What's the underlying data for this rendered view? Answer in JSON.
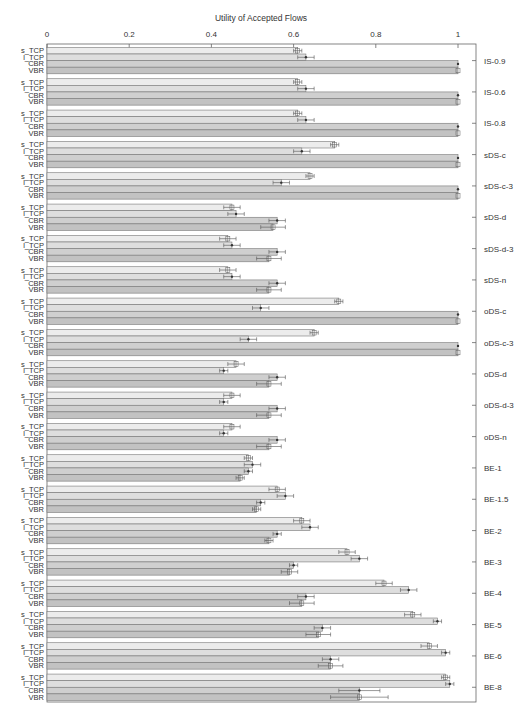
{
  "chart_data": {
    "type": "bar",
    "orientation": "horizontal",
    "title": "Utility of Accepted Flows",
    "xlabel": "Utility of Accepted Flows",
    "ylabel": "",
    "xlim": [
      0,
      1.046
    ],
    "x_ticks": [
      0,
      0.2,
      0.4,
      0.6,
      0.8,
      1
    ],
    "x_tick_labels": [
      "0",
      "0.2",
      "0.4",
      "0.6",
      "0.8",
      "1"
    ],
    "x_axis_position": "top",
    "grid": false,
    "legend": "per-bar inline labels on left (s_TCP, l_TCP, CBR, VBR)",
    "categories": [
      "IS-0.9",
      "IS-0.6",
      "IS-0.8",
      "sDS-c",
      "sDS-c-3",
      "sDS-d",
      "sDS-d-3",
      "sDS-n",
      "oDS-c",
      "oDS-c-3",
      "oDS-d",
      "oDS-d-3",
      "oDS-n",
      "BE-1",
      "BE-1.5",
      "BE-2",
      "BE-3",
      "BE-4",
      "BE-5",
      "BE-6",
      "BE-8"
    ],
    "series": [
      {
        "name": "s_TCP",
        "color": "#ececec",
        "values": [
          0.61,
          0.61,
          0.61,
          0.7,
          0.64,
          0.45,
          0.44,
          0.44,
          0.71,
          0.65,
          0.46,
          0.45,
          0.45,
          0.49,
          0.56,
          0.62,
          0.73,
          0.82,
          0.89,
          0.93,
          0.97
        ],
        "errors": [
          0.01,
          0.01,
          0.01,
          0.01,
          0.01,
          0.02,
          0.02,
          0.02,
          0.01,
          0.01,
          0.02,
          0.02,
          0.02,
          0.01,
          0.02,
          0.02,
          0.02,
          0.02,
          0.02,
          0.02,
          0.01
        ]
      },
      {
        "name": "l_TCP",
        "color": "#dedede",
        "values": [
          0.63,
          0.63,
          0.63,
          0.62,
          0.57,
          0.46,
          0.45,
          0.45,
          0.52,
          0.49,
          0.43,
          0.43,
          0.43,
          0.5,
          0.58,
          0.64,
          0.76,
          0.88,
          0.95,
          0.97,
          0.98
        ],
        "errors": [
          0.02,
          0.02,
          0.02,
          0.02,
          0.02,
          0.02,
          0.02,
          0.02,
          0.02,
          0.02,
          0.01,
          0.01,
          0.01,
          0.02,
          0.02,
          0.02,
          0.02,
          0.02,
          0.01,
          0.01,
          0.01
        ]
      },
      {
        "name": "CBR",
        "color": "#cfcfcf",
        "values": [
          1.0,
          1.0,
          1.0,
          1.0,
          1.0,
          0.56,
          0.56,
          0.56,
          1.0,
          1.0,
          0.56,
          0.56,
          0.56,
          0.49,
          0.52,
          0.56,
          0.6,
          0.63,
          0.67,
          0.69,
          0.76
        ],
        "errors": [
          0.0,
          0.0,
          0.0,
          0.0,
          0.0,
          0.02,
          0.02,
          0.02,
          0.0,
          0.0,
          0.02,
          0.02,
          0.02,
          0.01,
          0.01,
          0.01,
          0.01,
          0.02,
          0.02,
          0.02,
          0.05
        ]
      },
      {
        "name": "VBR",
        "color": "#c2c2c2",
        "values": [
          1.0,
          1.0,
          1.0,
          1.0,
          1.0,
          0.55,
          0.54,
          0.54,
          1.0,
          1.0,
          0.54,
          0.54,
          0.54,
          0.47,
          0.51,
          0.54,
          0.59,
          0.62,
          0.66,
          0.69,
          0.76
        ],
        "errors": [
          0.0,
          0.0,
          0.0,
          0.0,
          0.0,
          0.03,
          0.03,
          0.03,
          0.0,
          0.0,
          0.03,
          0.03,
          0.03,
          0.01,
          0.01,
          0.01,
          0.02,
          0.03,
          0.03,
          0.03,
          0.07
        ]
      }
    ]
  },
  "bar_labels": [
    "s_TCP",
    "l_TCP",
    "CBR",
    "VBR"
  ]
}
